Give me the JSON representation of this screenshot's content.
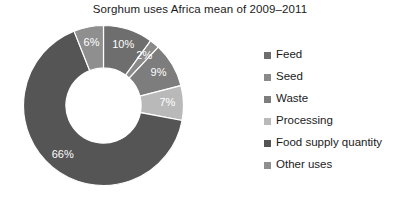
{
  "chart_data": {
    "type": "pie",
    "variant": "donut",
    "title": "Sorghum uses Africa mean of 2009–2011",
    "xlabel": "",
    "ylabel": "",
    "grid": false,
    "legend_position": "right",
    "start_angle_deg": 0,
    "direction": "clockwise",
    "inner_radius_ratio": 0.47,
    "categories": [
      "Feed",
      "Seed",
      "Waste",
      "Processing",
      "Food supply quantity",
      "Other uses"
    ],
    "values": [
      10,
      2,
      9,
      7,
      66,
      6
    ],
    "data_labels": [
      "10%",
      "2%",
      "9%",
      "7%",
      "66%",
      "6%"
    ],
    "colors": [
      "#6e6e6e",
      "#8a8a8a",
      "#7d7d7d",
      "#b9b9b9",
      "#555555",
      "#8f8f8f"
    ],
    "label_color": "#ffffff",
    "background": "#ffffff"
  },
  "legend": {
    "items": [
      {
        "label": "Feed",
        "color": "#6e6e6e"
      },
      {
        "label": "Seed",
        "color": "#8a8a8a"
      },
      {
        "label": "Waste",
        "color": "#7d7d7d"
      },
      {
        "label": "Processing",
        "color": "#b9b9b9"
      },
      {
        "label": "Food supply quantity",
        "color": "#555555"
      },
      {
        "label": "Other uses",
        "color": "#8f8f8f"
      }
    ]
  }
}
